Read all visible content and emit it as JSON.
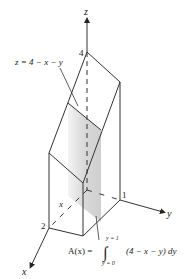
{
  "figure": {
    "surface_label": "z = 4 − x − y",
    "axes": {
      "x_label": "x",
      "y_label": "y",
      "z_label": "z"
    },
    "ticks": {
      "z_intercept": "4",
      "x_intercept": "2",
      "y_intercept": "1"
    },
    "slice_label": "x",
    "formula": {
      "lhs": "A(x) =",
      "integral_sign": "∫",
      "upper_limit": "y = 1",
      "lower_limit": "y = 0",
      "integrand": "(4 − x − y)",
      "differential": "dy"
    },
    "colors": {
      "line": "#333333",
      "shade": "#d9d9d9",
      "background": "#ffffff"
    }
  }
}
